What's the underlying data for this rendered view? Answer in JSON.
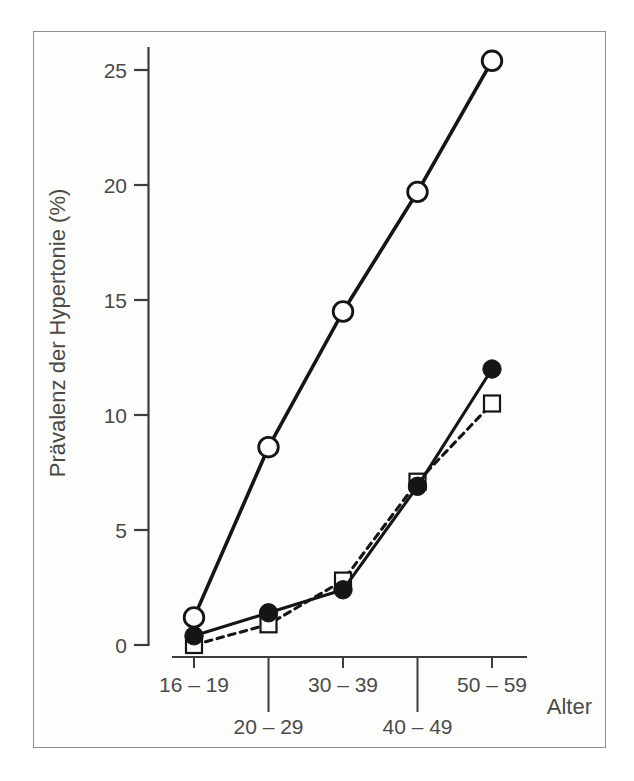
{
  "figure": {
    "background": "#fdfdfb",
    "border_color": "#8f8f8f",
    "axis_color": "#3c3c3c",
    "ink": "#151515",
    "text_color": "#4a4a4a"
  },
  "chart_data": {
    "type": "line",
    "ylabel": "Prävalenz der Hypertonie (%)",
    "xlabel": "Alter",
    "categories": [
      "16 – 19",
      "20 – 29",
      "30 – 39",
      "40 – 49",
      "50 – 59"
    ],
    "yticks": [
      0,
      5,
      10,
      15,
      20,
      25
    ],
    "ylim": [
      0,
      26.5
    ],
    "grid": false,
    "legend": false,
    "series": [
      {
        "name": "series-open-circle",
        "marker": "open-circle",
        "line": "solid",
        "values": [
          1.2,
          8.6,
          14.5,
          19.7,
          25.4
        ]
      },
      {
        "name": "series-filled-circle",
        "marker": "filled-circle",
        "line": "solid",
        "values": [
          0.4,
          1.4,
          2.4,
          6.9,
          12.0
        ]
      },
      {
        "name": "series-open-square",
        "marker": "open-square",
        "line": "dashed",
        "values": [
          0.0,
          0.9,
          2.8,
          7.1,
          10.5
        ]
      }
    ]
  }
}
